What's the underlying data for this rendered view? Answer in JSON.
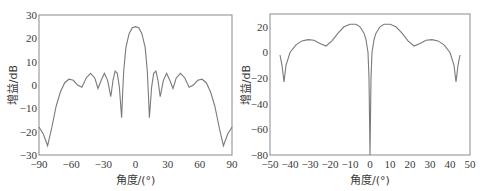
{
  "chart_data": [
    {
      "type": "line",
      "title": "",
      "xlabel": "角度/(°)",
      "ylabel": "增益/dB",
      "xlim": [
        -90,
        90
      ],
      "ylim": [
        -30,
        30
      ],
      "xticks": [
        "-90",
        "-60",
        "-30",
        "0",
        "30",
        "60",
        "90"
      ],
      "yticks": [
        "30",
        "20",
        "10",
        "0",
        "-10",
        "-20",
        "-30"
      ],
      "grid": false,
      "legend": null,
      "series": [
        {
          "name": "gain",
          "x": [
            -90,
            -86,
            -82,
            -78,
            -74,
            -70,
            -66,
            -62,
            -58,
            -54,
            -50,
            -46,
            -42,
            -38,
            -35,
            -32,
            -29,
            -26,
            -23,
            -21,
            -19,
            -17,
            -15,
            -13,
            -12,
            -11,
            -9,
            -6,
            -3,
            0,
            3,
            6,
            9,
            11,
            12,
            13,
            15,
            17,
            19,
            21,
            23,
            26,
            29,
            32,
            35,
            38,
            42,
            46,
            50,
            54,
            58,
            62,
            66,
            70,
            74,
            78,
            82,
            86,
            90
          ],
          "y": [
            -18,
            -21,
            -26,
            -18,
            -9,
            -3,
            1,
            2.5,
            2,
            0,
            -1,
            3,
            5,
            3,
            -1.5,
            2,
            5,
            2,
            -5,
            2,
            6,
            5,
            -1,
            -14,
            -4,
            6,
            16,
            22,
            24.5,
            25,
            24.5,
            22,
            16,
            6,
            -4,
            -14,
            -1,
            5,
            6,
            2,
            -5,
            2,
            5,
            2,
            -1.5,
            3,
            5,
            3,
            -1,
            0,
            2,
            2.5,
            1,
            -3,
            -9,
            -18,
            -26,
            -21,
            -18
          ]
        }
      ]
    },
    {
      "type": "line",
      "title": "",
      "xlabel": "角度/(°)",
      "ylabel": "增益/dB",
      "xlim": [
        -50,
        50
      ],
      "ylim": [
        -80,
        30
      ],
      "xticks": [
        "-50",
        "-40",
        "-30",
        "-20",
        "-10",
        "0",
        "10",
        "20",
        "30",
        "40",
        "50"
      ],
      "yticks": [
        "20",
        "0",
        "-20",
        "-40",
        "-60",
        "-80"
      ],
      "grid": false,
      "legend": null,
      "series": [
        {
          "name": "gain",
          "x": [
            -45,
            -44,
            -43,
            -42,
            -40,
            -37,
            -34,
            -31,
            -28,
            -25,
            -22,
            -19,
            -16,
            -13,
            -10,
            -7,
            -5,
            -3,
            -2,
            -1,
            -0.5,
            0,
            0.5,
            1,
            2,
            3,
            5,
            7,
            10,
            13,
            16,
            19,
            22,
            25,
            28,
            31,
            34,
            37,
            40,
            42,
            43,
            44,
            45
          ],
          "y": [
            -2,
            -10,
            -23,
            -10,
            0,
            6,
            9,
            10,
            9.5,
            7,
            5,
            9,
            15,
            20,
            22,
            22,
            20,
            15,
            10,
            0,
            -20,
            -80,
            -20,
            0,
            10,
            15,
            20,
            22,
            22,
            20,
            15,
            9,
            5,
            7,
            9.5,
            10,
            9,
            6,
            0,
            -10,
            -23,
            -10,
            -2
          ]
        }
      ]
    }
  ],
  "charts": [
    {
      "ylabel": "增益/dB",
      "xlabel": "角度/(°)",
      "xticks": [
        "-90",
        "-60",
        "-30",
        "0",
        "30",
        "60",
        "90"
      ],
      "yticks": [
        "30",
        "20",
        "10",
        "0",
        "-10",
        "-20",
        "-30"
      ]
    },
    {
      "ylabel": "增益/dB",
      "xlabel": "角度/(°)",
      "xticks": [
        "-50",
        "-40",
        "-30",
        "-20",
        "-10",
        "0",
        "10",
        "20",
        "30",
        "40",
        "50"
      ],
      "yticks": [
        "20",
        "0",
        "-20",
        "-40",
        "-60",
        "-80"
      ]
    }
  ],
  "colors": {
    "line": "#7a7a7a",
    "frame": "#8a8a8a",
    "text": "#3a3a3a"
  }
}
